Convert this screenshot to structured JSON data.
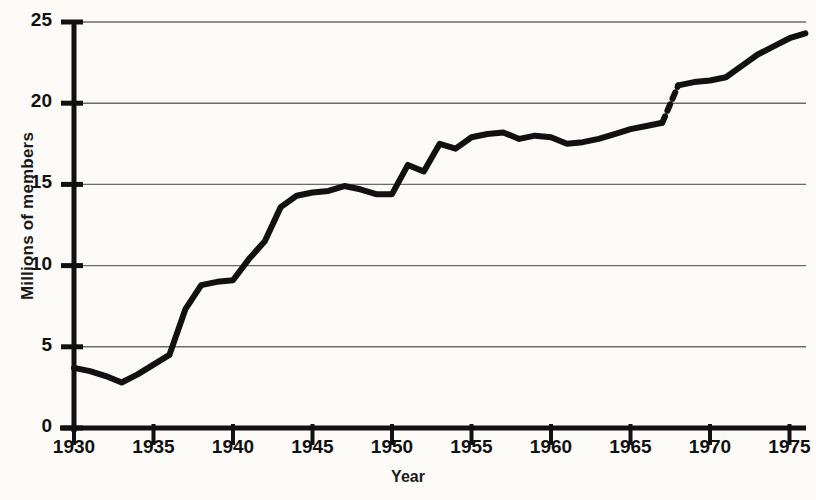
{
  "chart_data": {
    "type": "line",
    "title": "",
    "xlabel": "Year",
    "ylabel": "Millions of members",
    "xlim": [
      1930,
      1976
    ],
    "ylim": [
      0,
      25
    ],
    "grid": true,
    "grid_axis": "y",
    "legend": "none",
    "xticks": [
      "1930",
      "1935",
      "1940",
      "1945",
      "1950",
      "1955",
      "1960",
      "1965",
      "1970",
      "1975"
    ],
    "xtick_values": [
      1930,
      1935,
      1940,
      1945,
      1950,
      1955,
      1960,
      1965,
      1970,
      1975
    ],
    "yticks": [
      "0",
      "5",
      "10",
      "15",
      "20",
      "25"
    ],
    "ytick_values": [
      0,
      5,
      10,
      15,
      20,
      25
    ],
    "line_color": "#111111",
    "line_width_px": 6,
    "background_color": "#fbfaf7",
    "axis_color": "#111111",
    "gridline_color": "#6a6a6a",
    "annotations": [
      {
        "kind": "series-break",
        "style": "dashed",
        "from_x": 1967.0,
        "to_x": 1968.0,
        "from_y": 18.8,
        "to_y": 21.1,
        "note": "dashed discontinuity segment in line"
      }
    ],
    "x": [
      1930,
      1931,
      1932,
      1933,
      1934,
      1935,
      1936,
      1937,
      1938,
      1939,
      1940,
      1941,
      1942,
      1943,
      1944,
      1945,
      1946,
      1947,
      1948,
      1949,
      1950,
      1951,
      1952,
      1953,
      1954,
      1955,
      1956,
      1957,
      1958,
      1959,
      1960,
      1961,
      1962,
      1963,
      1964,
      1965,
      1966,
      1967,
      1968,
      1969,
      1970,
      1971,
      1972,
      1973,
      1974,
      1975,
      1976
    ],
    "values": [
      3.7,
      3.5,
      3.2,
      2.8,
      3.3,
      3.9,
      4.5,
      7.3,
      8.8,
      9.0,
      9.1,
      10.4,
      11.5,
      13.6,
      14.3,
      14.5,
      14.6,
      14.9,
      14.7,
      14.4,
      14.4,
      16.2,
      15.8,
      17.5,
      17.2,
      17.9,
      18.1,
      18.2,
      17.8,
      18.0,
      17.9,
      17.5,
      17.6,
      17.8,
      18.1,
      18.4,
      18.6,
      18.8,
      21.1,
      21.3,
      21.4,
      21.6,
      22.3,
      23.0,
      23.5,
      24.0,
      24.3
    ],
    "segments": [
      {
        "dash": false,
        "points": [
          [
            1930,
            3.7
          ],
          [
            1931,
            3.5
          ],
          [
            1932,
            3.2
          ],
          [
            1933,
            2.8
          ],
          [
            1934,
            3.3
          ],
          [
            1935,
            3.9
          ],
          [
            1936,
            4.5
          ],
          [
            1937,
            7.3
          ],
          [
            1938,
            8.8
          ],
          [
            1939,
            9.0
          ],
          [
            1940,
            9.1
          ],
          [
            1941,
            10.4
          ],
          [
            1942,
            11.5
          ],
          [
            1943,
            13.6
          ],
          [
            1944,
            14.3
          ],
          [
            1945,
            14.5
          ],
          [
            1946,
            14.6
          ],
          [
            1947,
            14.9
          ],
          [
            1948,
            14.7
          ],
          [
            1949,
            14.4
          ],
          [
            1950,
            14.4
          ],
          [
            1951,
            16.2
          ],
          [
            1952,
            15.8
          ],
          [
            1953,
            17.5
          ],
          [
            1954,
            17.2
          ],
          [
            1955,
            17.9
          ],
          [
            1956,
            18.1
          ],
          [
            1957,
            18.2
          ],
          [
            1958,
            17.8
          ],
          [
            1959,
            18.0
          ],
          [
            1960,
            17.9
          ],
          [
            1961,
            17.5
          ],
          [
            1962,
            17.6
          ],
          [
            1963,
            17.8
          ],
          [
            1964,
            18.1
          ],
          [
            1965,
            18.4
          ],
          [
            1966,
            18.6
          ],
          [
            1967,
            18.8
          ]
        ]
      },
      {
        "dash": true,
        "points": [
          [
            1967,
            18.8
          ],
          [
            1968,
            21.1
          ]
        ]
      },
      {
        "dash": false,
        "points": [
          [
            1968,
            21.1
          ],
          [
            1969,
            21.3
          ],
          [
            1970,
            21.4
          ],
          [
            1971,
            21.6
          ],
          [
            1972,
            22.3
          ],
          [
            1973,
            23.0
          ],
          [
            1974,
            23.5
          ],
          [
            1975,
            24.0
          ],
          [
            1976,
            24.3
          ]
        ]
      }
    ]
  },
  "axes": {
    "ylabel": "Millions of members",
    "xlabel": "Year"
  }
}
